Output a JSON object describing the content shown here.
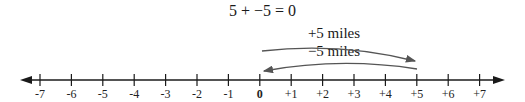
{
  "equation": "5 + −5 = 0",
  "arrows": {
    "forward": {
      "label": "+5 miles",
      "from": 0,
      "to": 5
    },
    "backward": {
      "label": "−5 miles",
      "from": 5,
      "to": 0
    }
  },
  "number_line": {
    "min": -7,
    "max": 7,
    "ticks": [
      "-7",
      "-6",
      "-5",
      "-4",
      "-3",
      "-2",
      "-1",
      "0",
      "+1",
      "+2",
      "+3",
      "+4",
      "+5",
      "+6",
      "+7"
    ],
    "bold_tick": "0"
  },
  "colors": {
    "axis": "#1a1a1a",
    "arrow": "#555555"
  }
}
